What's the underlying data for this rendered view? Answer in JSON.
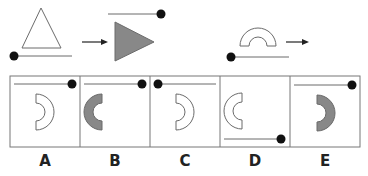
{
  "puzzle": {
    "example": {
      "from": {
        "shape": "outlined-triangle-pointing-up",
        "line": "bottom",
        "dot": "left"
      },
      "to": {
        "shape": "filled-gray-triangle-pointing-right",
        "line": "top",
        "dot": "right"
      }
    },
    "question": {
      "shape": "outlined-half-annulus-opening-down",
      "line": "bottom",
      "dot": "left"
    },
    "options": [
      {
        "label": "A",
        "shape": "outlined-half-annulus-opening-left",
        "line": "top",
        "dot": "right"
      },
      {
        "label": "B",
        "shape": "filled-half-annulus-opening-right",
        "line": "top",
        "dot": "right"
      },
      {
        "label": "C",
        "shape": "outlined-half-annulus-opening-left",
        "line": "top",
        "dot": "left"
      },
      {
        "label": "D",
        "shape": "outlined-half-annulus-opening-right",
        "line": "bottom",
        "dot": "right"
      },
      {
        "label": "E",
        "shape": "filled-half-annulus-opening-left",
        "line": "top",
        "dot": "right"
      }
    ]
  },
  "colors": {
    "stroke": "#6b6b6b",
    "fill": "#888888",
    "dot": "#111111",
    "border": "#777777"
  }
}
